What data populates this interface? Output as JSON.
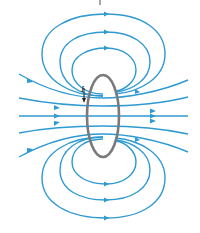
{
  "diagram": {
    "current_label": "I",
    "colors": {
      "field_line": "#2f9ad0",
      "loop": "#7a7a7a",
      "label": "#222222"
    },
    "elements": {
      "current_loop": "ellipse viewed edge-on",
      "field_lines_top": 3,
      "field_lines_bottom": 3,
      "through_lines": 5
    }
  }
}
